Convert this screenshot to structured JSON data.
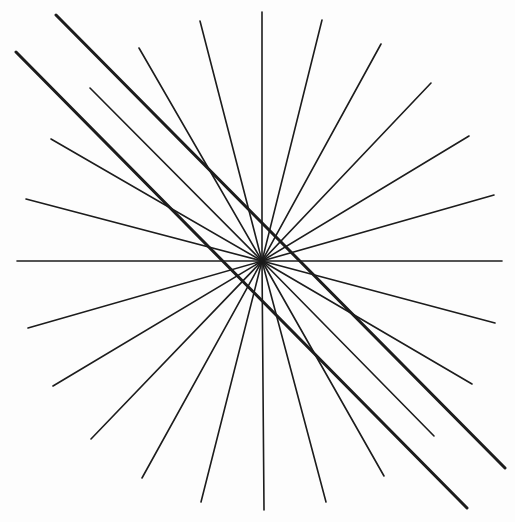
{
  "figure": {
    "background": "#fdfdfd",
    "ink": "#1c1c1c",
    "center": [
      262,
      261
    ],
    "rays": [
      [
        262,
        12
      ],
      [
        322,
        20
      ],
      [
        381,
        44
      ],
      [
        431,
        83
      ],
      [
        469,
        136
      ],
      [
        494,
        195
      ],
      [
        502,
        261
      ],
      [
        495,
        323
      ],
      [
        472,
        384
      ],
      [
        434,
        436
      ],
      [
        384,
        476
      ],
      [
        326,
        502
      ],
      [
        264,
        510
      ],
      [
        201,
        502
      ],
      [
        142,
        478
      ],
      [
        91,
        439
      ],
      [
        53,
        386
      ],
      [
        28,
        328
      ],
      [
        17,
        261
      ],
      [
        26,
        199
      ],
      [
        51,
        139
      ],
      [
        90,
        88
      ],
      [
        139,
        48
      ],
      [
        200,
        21
      ]
    ],
    "ray_width": 1.6,
    "parallel_lines": [
      {
        "from": [
          56,
          15
        ],
        "to": [
          505,
          468
        ]
      },
      {
        "from": [
          16,
          52
        ],
        "to": [
          467,
          508
        ]
      }
    ],
    "parallel_width": 3
  }
}
